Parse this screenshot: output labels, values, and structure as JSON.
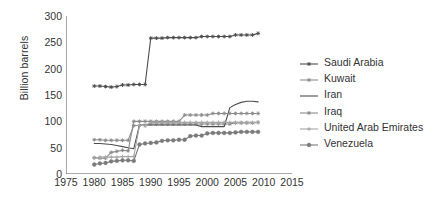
{
  "chart_data": {
    "type": "line",
    "title": "",
    "xlabel": "",
    "ylabel": "Billion barrels",
    "xlim": [
      1975,
      2015
    ],
    "ylim": [
      0,
      300
    ],
    "xticks": [
      1975,
      1980,
      1985,
      1990,
      1995,
      2000,
      2005,
      2010,
      2015
    ],
    "yticks": [
      0,
      50,
      100,
      150,
      200,
      250,
      300
    ],
    "grid": false,
    "legend_position": "right",
    "x": [
      1980,
      1981,
      1982,
      1983,
      1984,
      1985,
      1986,
      1987,
      1988,
      1989,
      1990,
      1991,
      1992,
      1993,
      1994,
      1995,
      1996,
      1997,
      1998,
      1999,
      2000,
      2001,
      2002,
      2003,
      2004,
      2005,
      2006,
      2007,
      2008,
      2009
    ],
    "series": [
      {
        "name": "Saudi Arabia",
        "color": "#4d4d4d",
        "marker": "star",
        "values": [
          167,
          167,
          166,
          165,
          166,
          169,
          169,
          170,
          170,
          170,
          258,
          258,
          258,
          259,
          259,
          259,
          259,
          259,
          259,
          261,
          261,
          261,
          261,
          261,
          261,
          264,
          264,
          264,
          264,
          267
        ]
      },
      {
        "name": "Kuwait",
        "color": "#8c8c8c",
        "marker": "star",
        "values": [
          65,
          65,
          64,
          64,
          64,
          64,
          64,
          92,
          92,
          92,
          95,
          95,
          95,
          95,
          95,
          95,
          95,
          95,
          95,
          95,
          95,
          95,
          95,
          95,
          95,
          97,
          97,
          97,
          97,
          98
        ]
      },
      {
        "name": "Iran",
        "color": "#4d4d4d",
        "marker": "none",
        "values": [
          58,
          58,
          57,
          56,
          54,
          52,
          50,
          48,
          93,
          93,
          93,
          93,
          93,
          93,
          93,
          93,
          93,
          93,
          93,
          90,
          90,
          90,
          90,
          90,
          126,
          132,
          136,
          138,
          138,
          137
        ]
      },
      {
        "name": "Iraq",
        "color": "#8c8c8c",
        "marker": "star",
        "values": [
          31,
          30,
          30,
          41,
          43,
          45,
          44,
          100,
          100,
          100,
          100,
          100,
          100,
          100,
          100,
          100,
          112,
          112,
          112,
          112,
          112,
          115,
          115,
          115,
          115,
          115,
          115,
          115,
          115,
          115
        ]
      },
      {
        "name": "United Arab Emirates",
        "color": "#a6a6a6",
        "marker": "plus",
        "values": [
          30,
          32,
          32,
          32,
          32,
          33,
          33,
          33,
          92,
          92,
          98,
          98,
          98,
          98,
          98,
          98,
          98,
          98,
          98,
          98,
          98,
          98,
          98,
          98,
          98,
          98,
          98,
          98,
          98,
          98
        ]
      },
      {
        "name": "Venezuela",
        "color": "#7a7a7a",
        "marker": "circle",
        "values": [
          18,
          20,
          21,
          24,
          25,
          26,
          26,
          25,
          56,
          58,
          59,
          60,
          63,
          64,
          64,
          65,
          65,
          72,
          73,
          73,
          77,
          78,
          78,
          78,
          78,
          79,
          80,
          80,
          80,
          80
        ]
      }
    ]
  }
}
